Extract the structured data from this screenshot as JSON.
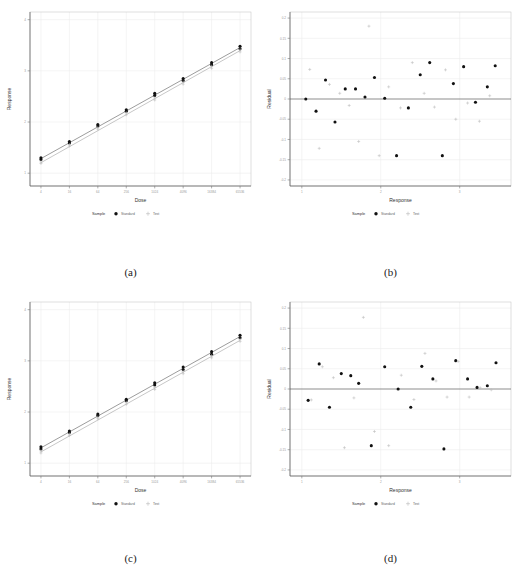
{
  "figure": {
    "panels": [
      "a",
      "b",
      "c",
      "d"
    ],
    "captions": {
      "a": "(a)",
      "b": "(b)",
      "c": "(c)",
      "d": "(d)"
    },
    "legend": {
      "title": "Sample",
      "standard_label": "Standard",
      "standard_marker": "filled-circle",
      "test_label": "Test",
      "test_marker": "plus"
    },
    "colors": {
      "standard": "#111111",
      "test": "#b9b9b9",
      "fit_line": "#4a4a4a",
      "grid": "#ededed",
      "axis": "#555555",
      "frame": "#c9c9c9"
    }
  },
  "chart_data": [
    {
      "id": "a",
      "type": "scatter",
      "title": "",
      "xlabel": "Dose",
      "ylabel": "Response",
      "xscale": "log2",
      "xticks": [
        4,
        16,
        64,
        256,
        1024,
        4096,
        16384,
        65536
      ],
      "xticklabels": [
        "4",
        "16",
        "64",
        "256",
        "1024",
        "4096",
        "16384",
        "65536"
      ],
      "yticks": [
        1,
        2,
        3,
        4
      ],
      "yticklabels": [
        "1",
        "2",
        "3",
        "4"
      ],
      "ylim": [
        0.75,
        4.15
      ],
      "grid": true,
      "legend_position": "bottom",
      "series": [
        {
          "name": "Standard",
          "marker": "filled-circle",
          "x": [
            4,
            4,
            16,
            16,
            64,
            64,
            256,
            256,
            1024,
            1024,
            4096,
            4096,
            16384,
            16384,
            65536,
            65536
          ],
          "y": [
            1.3,
            1.27,
            1.62,
            1.59,
            1.95,
            1.92,
            2.24,
            2.21,
            2.56,
            2.52,
            2.85,
            2.81,
            3.16,
            3.12,
            3.48,
            3.43
          ]
        },
        {
          "name": "Test",
          "marker": "plus",
          "x": [
            4,
            4,
            16,
            16,
            64,
            64,
            256,
            256,
            1024,
            1024,
            4096,
            4096,
            16384,
            16384,
            65536,
            65536
          ],
          "y": [
            1.22,
            1.19,
            1.56,
            1.53,
            1.89,
            1.86,
            2.18,
            2.14,
            2.47,
            2.43,
            2.78,
            2.74,
            3.09,
            3.05,
            3.41,
            3.37
          ]
        }
      ],
      "fits": [
        {
          "name": "Standard",
          "x": [
            4,
            65536
          ],
          "y": [
            1.285,
            3.455
          ]
        },
        {
          "name": "Test",
          "x": [
            4,
            65536
          ],
          "y": [
            1.205,
            3.395
          ]
        }
      ]
    },
    {
      "id": "b",
      "type": "scatter",
      "title": "",
      "xlabel": "Response",
      "ylabel": "Residual",
      "xticks": [
        1,
        2,
        3
      ],
      "xticklabels": [
        "1",
        "2",
        "3"
      ],
      "yticks": [
        0.2,
        0.15,
        0.1,
        0.05,
        0,
        -0.05,
        -0.1,
        -0.15,
        -0.2
      ],
      "yticklabels": [
        "0.2",
        "0.15",
        "0.1",
        "0.05",
        "0",
        "-0.05",
        "-0.1",
        "-0.15",
        "-0.2"
      ],
      "ylim": [
        -0.215,
        0.215
      ],
      "xlim": [
        0.85,
        3.65
      ],
      "grid": true,
      "reference_line": 0,
      "legend_position": "bottom",
      "series": [
        {
          "name": "Standard",
          "marker": "filled-circle",
          "x": [
            1.05,
            1.18,
            1.3,
            1.42,
            1.55,
            1.68,
            1.8,
            1.92,
            2.05,
            2.2,
            2.35,
            2.5,
            2.62,
            2.78,
            2.92,
            3.05,
            3.2,
            3.35,
            3.45
          ],
          "y": [
            0.0,
            -0.03,
            0.047,
            -0.057,
            0.025,
            0.025,
            0.005,
            0.053,
            0.002,
            -0.14,
            -0.022,
            0.06,
            0.09,
            -0.14,
            0.038,
            0.08,
            -0.008,
            0.03,
            0.082
          ]
        },
        {
          "name": "Test",
          "marker": "plus",
          "x": [
            1.1,
            1.22,
            1.35,
            1.48,
            1.6,
            1.72,
            1.85,
            1.98,
            2.1,
            2.25,
            2.4,
            2.55,
            2.68,
            2.82,
            2.95,
            3.1,
            3.25,
            3.38
          ],
          "y": [
            0.073,
            -0.122,
            0.036,
            0.014,
            -0.016,
            -0.105,
            0.18,
            -0.14,
            0.03,
            -0.022,
            0.09,
            0.014,
            -0.02,
            0.072,
            -0.05,
            -0.01,
            -0.055,
            0.008
          ]
        }
      ]
    },
    {
      "id": "c",
      "type": "scatter",
      "title": "",
      "xlabel": "Dose",
      "ylabel": "Response",
      "xscale": "log2",
      "xticks": [
        4,
        16,
        64,
        256,
        1024,
        4096,
        16384,
        65536
      ],
      "xticklabels": [
        "4",
        "16",
        "64",
        "256",
        "1024",
        "4096",
        "16384",
        "65536"
      ],
      "yticks": [
        1,
        2,
        3,
        4
      ],
      "yticklabels": [
        "1",
        "2",
        "3",
        "4"
      ],
      "ylim": [
        0.75,
        4.15
      ],
      "grid": true,
      "legend_position": "bottom",
      "series": [
        {
          "name": "Standard",
          "marker": "filled-circle",
          "x": [
            4,
            4,
            16,
            16,
            64,
            64,
            256,
            256,
            1024,
            1024,
            4096,
            4096,
            16384,
            16384,
            65536,
            65536
          ],
          "y": [
            1.32,
            1.28,
            1.63,
            1.6,
            1.96,
            1.93,
            2.25,
            2.22,
            2.57,
            2.53,
            2.88,
            2.83,
            3.18,
            3.13,
            3.5,
            3.45
          ]
        },
        {
          "name": "Test",
          "marker": "plus",
          "x": [
            4,
            4,
            16,
            16,
            64,
            64,
            256,
            256,
            1024,
            1024,
            4096,
            4096,
            16384,
            16384,
            65536,
            65536
          ],
          "y": [
            1.24,
            1.2,
            1.57,
            1.54,
            1.9,
            1.87,
            2.19,
            2.15,
            2.48,
            2.44,
            2.79,
            2.75,
            3.1,
            3.06,
            3.42,
            3.38
          ]
        }
      ],
      "fits": [
        {
          "name": "Standard",
          "x": [
            4,
            65536
          ],
          "y": [
            1.3,
            3.475
          ]
        },
        {
          "name": "Test",
          "x": [
            4,
            65536
          ],
          "y": [
            1.22,
            3.4
          ]
        }
      ]
    },
    {
      "id": "d",
      "type": "scatter",
      "title": "",
      "xlabel": "Response",
      "ylabel": "Residual",
      "xticks": [
        1,
        2,
        3
      ],
      "xticklabels": [
        "1",
        "2",
        "3"
      ],
      "yticks": [
        0.2,
        0.15,
        0.1,
        0.05,
        0,
        -0.05,
        -0.1,
        -0.15,
        -0.2
      ],
      "yticklabels": [
        "0.2",
        "0.15",
        "0.1",
        "0.05",
        "0",
        "-0.05",
        "-0.1",
        "-0.15",
        "-0.2"
      ],
      "ylim": [
        -0.215,
        0.215
      ],
      "xlim": [
        0.85,
        3.65
      ],
      "grid": true,
      "reference_line": 0,
      "legend_position": "bottom",
      "series": [
        {
          "name": "Standard",
          "marker": "filled-circle",
          "x": [
            1.08,
            1.22,
            1.35,
            1.5,
            1.62,
            1.72,
            1.88,
            2.05,
            2.22,
            2.38,
            2.52,
            2.66,
            2.8,
            2.95,
            3.1,
            3.22,
            3.35,
            3.46
          ],
          "y": [
            -0.028,
            0.062,
            -0.045,
            0.038,
            0.033,
            0.014,
            -0.14,
            0.055,
            0.0,
            -0.045,
            0.056,
            0.025,
            -0.148,
            0.07,
            0.025,
            0.004,
            0.008,
            0.065
          ]
        },
        {
          "name": "Test",
          "marker": "plus",
          "x": [
            1.12,
            1.26,
            1.4,
            1.54,
            1.66,
            1.78,
            1.92,
            2.1,
            2.26,
            2.42,
            2.56,
            2.7,
            2.84,
            2.98,
            3.12,
            3.26,
            3.4
          ],
          "y": [
            -0.027,
            0.055,
            0.028,
            -0.145,
            -0.022,
            0.177,
            -0.105,
            -0.14,
            0.034,
            -0.026,
            0.088,
            0.02,
            -0.02,
            0.068,
            -0.02,
            0.003,
            -0.002
          ]
        }
      ]
    }
  ]
}
